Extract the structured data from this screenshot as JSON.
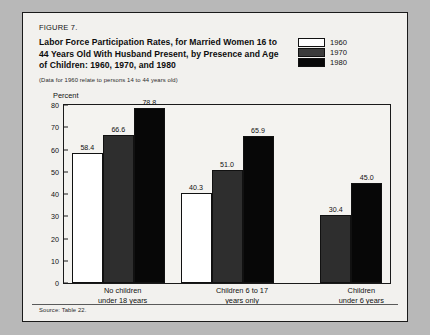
{
  "figure": {
    "number": "FIGURE 7.",
    "title": "Labor Force Participation Rates, for Married Women 16 to 44 Years Old With Husband Present, by Presence and Age of Children: 1960, 1970, and 1980",
    "note": "(Data for 1960 relate to persons 14 to 44 years old)",
    "source": "Source: Table 22."
  },
  "legend": {
    "items": [
      {
        "label": "1960",
        "swatch": "white-swatch",
        "color": "#ffffff"
      },
      {
        "label": "1970",
        "swatch": "gray-swatch",
        "color": "#2e2e2e"
      },
      {
        "label": "1980",
        "swatch": "black-swatch",
        "color": "#070707"
      }
    ]
  },
  "chart_data": {
    "type": "bar",
    "title": "Labor Force Participation Rates, for Married Women 16 to 44 Years Old With Husband Present, by Presence and Age of Children: 1960, 1970, and 1980",
    "xlabel": "",
    "ylabel": "Percent",
    "ylim": [
      0,
      80
    ],
    "yticks": [
      0,
      10,
      20,
      30,
      40,
      50,
      60,
      70,
      80
    ],
    "grid": false,
    "legend_position": "top-right",
    "categories": [
      "No children under 18 years",
      "Children 6 to 17 years only",
      "Children under 6 years"
    ],
    "series": [
      {
        "name": "1960",
        "values": [
          58.4,
          40.3,
          null
        ]
      },
      {
        "name": "1970",
        "values": [
          66.6,
          51.0,
          30.4
        ]
      },
      {
        "name": "1980",
        "values": [
          78.8,
          65.9,
          45.0
        ]
      }
    ],
    "value_labels": [
      [
        "58.4",
        "66.6",
        "78.8"
      ],
      [
        "40.3",
        "51.0",
        "65.9"
      ],
      [
        "30.4",
        "45.0"
      ]
    ]
  },
  "axis": {
    "y_unit_label": "Percent",
    "tick_labels": [
      "80",
      "70",
      "60",
      "50",
      "40",
      "30",
      "20",
      "10",
      "0"
    ]
  },
  "xlabels": [
    {
      "line1": "No children",
      "line2": "under 18 years"
    },
    {
      "line1": "Children  6 to 17",
      "line2": "years only"
    },
    {
      "line1": "Children",
      "line2": "under 6 years"
    }
  ]
}
